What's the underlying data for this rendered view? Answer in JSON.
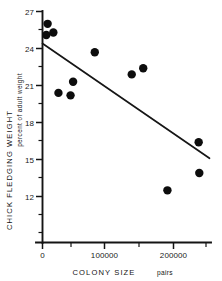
{
  "chart_data": {
    "type": "scatter",
    "title": "",
    "xlabel": "COLONY SIZE   pairs",
    "xlabel_main": "COLONY SIZE",
    "xlabel_unit": "pairs",
    "ylabel": "CHICK FLEDGING WEIGHT",
    "ylabel_sub": "percent of adult weight",
    "xlim": [
      0,
      262000
    ],
    "ylim": [
      11.0,
      27.0
    ],
    "grid": false,
    "legend": "none",
    "x_ticks": [
      0,
      100000,
      200000
    ],
    "x_tick_labels": [
      "0",
      "100000",
      "200000"
    ],
    "x_minor_ticks": [
      50000,
      150000,
      250000
    ],
    "y_ticks": [
      12,
      15,
      18,
      21,
      24,
      27
    ],
    "y_tick_labels": [
      "12",
      "15",
      "18",
      "21",
      "24",
      "27"
    ],
    "y_minor_ticks": [
      13.5,
      16.5,
      19.5,
      22.5,
      25.5
    ],
    "marker": "filled-circle",
    "marker_color": "#0d0d0d",
    "points": [
      {
        "x": 8000,
        "y": 26.0
      },
      {
        "x": 6000,
        "y": 25.1
      },
      {
        "x": 17000,
        "y": 25.3
      },
      {
        "x": 82000,
        "y": 23.7
      },
      {
        "x": 140000,
        "y": 21.9
      },
      {
        "x": 158000,
        "y": 22.4
      },
      {
        "x": 48000,
        "y": 21.3
      },
      {
        "x": 25000,
        "y": 20.4
      },
      {
        "x": 44000,
        "y": 20.2
      },
      {
        "x": 245000,
        "y": 16.4
      },
      {
        "x": 246000,
        "y": 13.9
      },
      {
        "x": 196000,
        "y": 12.5
      }
    ],
    "fit_line": {
      "type": "linear-regression",
      "x_start": 0,
      "y_start": 24.4,
      "x_end": 262000,
      "y_end": 15.1
    }
  }
}
